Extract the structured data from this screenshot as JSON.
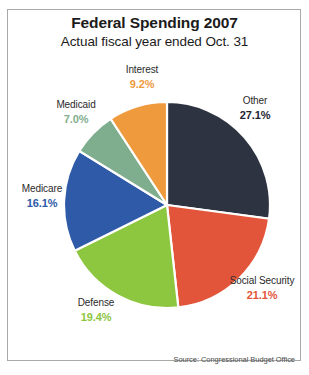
{
  "chart_data": {
    "type": "pie",
    "title": "Federal Spending 2007",
    "subtitle": "Actual fiscal year ended Oct. 31",
    "source": "Source: Congressional Budget Office",
    "unit": "%",
    "start_angle_deg": 0,
    "direction": "clockwise",
    "legend": "none (direct labels)",
    "categories": [
      "Other",
      "Social Security",
      "Defense",
      "Medicare",
      "Medicaid",
      "Interest"
    ],
    "values": [
      27.1,
      21.1,
      19.4,
      16.1,
      7.0,
      9.2
    ],
    "slices": [
      {
        "label": "Other",
        "value": 27.1,
        "display": "27.1%",
        "color": "#2d3340",
        "text_color": "#22252e",
        "label_pos": "right-top"
      },
      {
        "label": "Social Security",
        "value": 21.1,
        "display": "21.1%",
        "color": "#e2553a",
        "text_color": "#e2553a",
        "label_pos": "right-bottom"
      },
      {
        "label": "Defense",
        "value": 19.4,
        "display": "19.4%",
        "color": "#8dc63f",
        "text_color": "#8dc63f",
        "label_pos": "bottom"
      },
      {
        "label": "Medicare",
        "value": 16.1,
        "display": "16.1%",
        "color": "#2e5aa8",
        "text_color": "#2e5aa8",
        "label_pos": "left"
      },
      {
        "label": "Medicaid",
        "value": 7.0,
        "display": "7.0%",
        "color": "#7fae8f",
        "text_color": "#7fae8f",
        "label_pos": "left-top"
      },
      {
        "label": "Interest",
        "value": 9.2,
        "display": "9.2%",
        "color": "#f09a3e",
        "text_color": "#f09a3e",
        "label_pos": "top"
      }
    ]
  },
  "header": {
    "title": "Federal Spending 2007",
    "subtitle": "Actual fiscal year ended Oct. 31"
  },
  "labels": {
    "interest": {
      "name": "Interest",
      "percent": "9.2%"
    },
    "medicaid": {
      "name": "Medicaid",
      "percent": "7.0%"
    },
    "medicare": {
      "name": "Medicare",
      "percent": "16.1%"
    },
    "defense": {
      "name": "Defense",
      "percent": "19.4%"
    },
    "social": {
      "name": "Social Security",
      "percent": "21.1%"
    },
    "other": {
      "name": "Other",
      "percent": "27.1%"
    }
  },
  "footer": {
    "source": "Source: Congressional Budget Office"
  }
}
